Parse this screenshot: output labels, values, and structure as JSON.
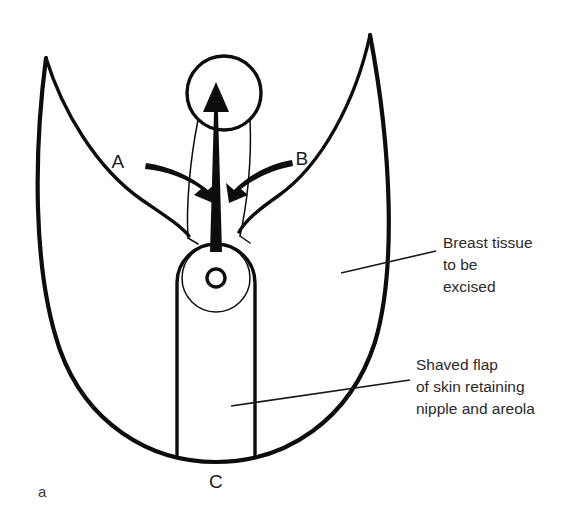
{
  "figure": {
    "panel_label": "a",
    "background_color": "#ffffff",
    "ink_color": "#0d0d0d"
  },
  "markers": {
    "a_label": "A",
    "b_label": "B",
    "c_label": "C"
  },
  "annotations": {
    "breast_tissue": {
      "line1": "Breast tissue",
      "line2": "to be",
      "line3": "excised"
    },
    "shaved_flap": {
      "line1": "Shaved flap",
      "line2": "of skin retaining",
      "line3": "nipple and areola"
    }
  },
  "parts": {
    "outer_outline": "breast-resection-outline",
    "left_wing": "left-wing-tip",
    "right_wing": "right-wing-tip",
    "new_nipple_site": "new-nipple-position-circle",
    "pedicle_flap": "vertical-dermal-flap",
    "areola": "areola-circle",
    "nipple": "nipple-circle",
    "transposition_arrow": "nipple-transposition-arrow",
    "arrow_a": "advancement-arrow-a",
    "arrow_b": "advancement-arrow-b"
  }
}
